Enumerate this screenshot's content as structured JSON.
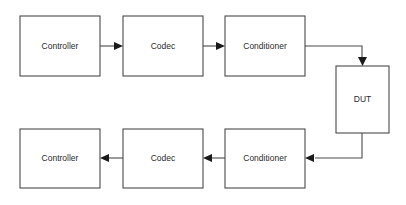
{
  "diagram": {
    "background_color": "#ffffff",
    "line_color": "#4a4a4a",
    "arrow_color": "#1a1a1a",
    "text_color": "#2b2b2b",
    "nodes": [
      {
        "id": "controller-top",
        "label": "Controller",
        "x": 20,
        "y": 16,
        "w": 80,
        "h": 60
      },
      {
        "id": "codec-top",
        "label": "Codec",
        "x": 123,
        "y": 16,
        "w": 80,
        "h": 60
      },
      {
        "id": "conditioner-top",
        "label": "Conditioner",
        "x": 225,
        "y": 16,
        "w": 80,
        "h": 60
      },
      {
        "id": "dut",
        "label": "DUT",
        "x": 336,
        "y": 66,
        "w": 53,
        "h": 67
      },
      {
        "id": "controller-bottom",
        "label": "Controller",
        "x": 20,
        "y": 129,
        "w": 80,
        "h": 59
      },
      {
        "id": "codec-bottom",
        "label": "Codec",
        "x": 123,
        "y": 129,
        "w": 80,
        "h": 59
      },
      {
        "id": "conditioner-bottom",
        "label": "Conditioner",
        "x": 225,
        "y": 129,
        "w": 80,
        "h": 59
      }
    ],
    "edges": [
      {
        "id": "controller-to-codec-top",
        "from": "controller-top",
        "to": "codec-top",
        "direction": "right"
      },
      {
        "id": "codec-to-conditioner-top",
        "from": "codec-top",
        "to": "conditioner-top",
        "direction": "right"
      },
      {
        "id": "conditioner-to-dut",
        "from": "conditioner-top",
        "to": "dut",
        "direction": "down"
      },
      {
        "id": "dut-to-conditioner-bottom",
        "from": "dut",
        "to": "conditioner-bottom",
        "direction": "left"
      },
      {
        "id": "conditioner-to-codec-bottom",
        "from": "conditioner-bottom",
        "to": "codec-bottom",
        "direction": "left"
      },
      {
        "id": "codec-to-controller-bottom",
        "from": "codec-bottom",
        "to": "controller-bottom",
        "direction": "left"
      }
    ]
  }
}
